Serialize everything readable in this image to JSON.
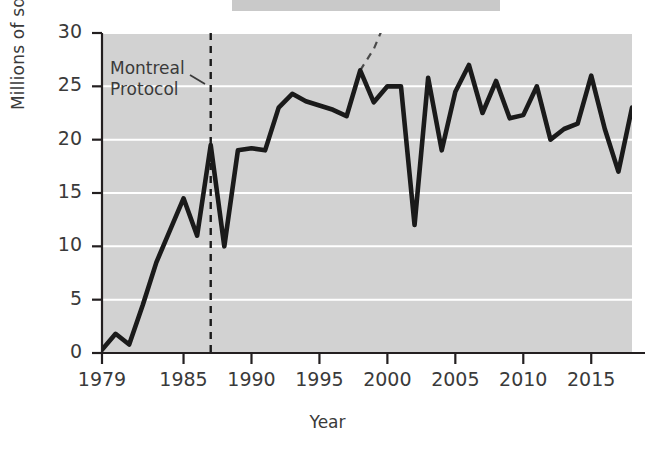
{
  "figure": {
    "top_bar_present": true,
    "plot_bg_color": "#d2d2d2",
    "gridline_color": "#ffffff",
    "line_color": "#1a1a1a",
    "text_color": "#3a3a3a"
  },
  "annotation": {
    "label": "Montreal\nProtocol",
    "line1": "Montreal",
    "line2": "Protocol",
    "marker_year": 1987
  },
  "chart_data": {
    "type": "line",
    "title": "",
    "xlabel": "Year",
    "ylabel": "Millions of sq km",
    "xlim": [
      1979,
      2018
    ],
    "ylim": [
      0,
      30
    ],
    "grid": true,
    "legend": "none",
    "ytick_labels": [
      "0",
      "5",
      "10",
      "15",
      "20",
      "25",
      "30"
    ],
    "yticks": [
      0,
      5,
      10,
      15,
      20,
      25,
      30
    ],
    "xtick_labels": [
      "1979",
      "1985",
      "1990",
      "1995",
      "2000",
      "2005",
      "2010",
      "2015"
    ],
    "xticks": [
      1979,
      1985,
      1990,
      1995,
      2000,
      2005,
      2010,
      2015
    ],
    "series": [
      {
        "name": "Ozone hole area",
        "style": "solid",
        "x": [
          1979,
          1980,
          1981,
          1982,
          1983,
          1984,
          1985,
          1986,
          1987,
          1988,
          1989,
          1990,
          1991,
          1992,
          1993,
          1994,
          1995,
          1996,
          1997,
          1998,
          1999,
          2000,
          2001,
          2002,
          2003,
          2004,
          2005,
          2006,
          2007,
          2008,
          2009,
          2010,
          2011,
          2012,
          2013,
          2014,
          2015,
          2016,
          2017,
          2018
        ],
        "values": [
          0.3,
          1.8,
          0.8,
          4.5,
          8.5,
          11.5,
          14.5,
          11.0,
          19.5,
          10.0,
          19.0,
          19.2,
          19.0,
          23.0,
          24.3,
          23.6,
          23.2,
          22.8,
          22.2,
          26.5,
          23.5,
          25.0,
          25.0,
          12.0,
          25.8,
          19.0,
          24.5,
          27.0,
          22.5,
          25.5,
          22.0,
          22.3,
          25.0,
          20.0,
          21.0,
          21.5,
          26.0,
          21.0,
          17.0,
          23.0
        ]
      },
      {
        "name": "Projection without Montreal Protocol",
        "style": "dashed",
        "x": [
          1998,
          1999,
          2000,
          2001,
          2002
        ],
        "values": [
          26.5,
          28.5,
          31.5,
          34.5,
          38.0
        ]
      }
    ],
    "vertical_markers": [
      {
        "year": 1987,
        "style": "dashed",
        "label": "Montreal Protocol"
      }
    ]
  },
  "axis_labels": {
    "y_title": "Millions of sq km",
    "x_title": "Year"
  }
}
